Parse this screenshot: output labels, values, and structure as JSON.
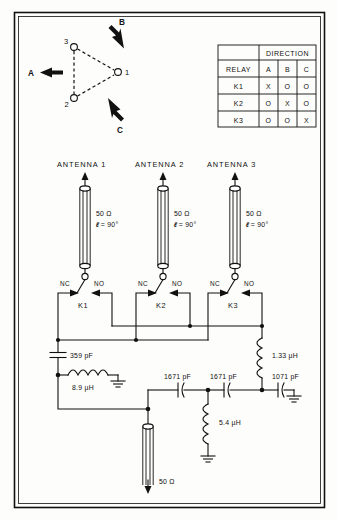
{
  "figure": {
    "border_color": "#111111",
    "background": "#fdfdfb"
  },
  "direction_diagram": {
    "name": "pattern-direction-diagram",
    "nodes": [
      {
        "id": "1",
        "label": "1",
        "x": 118,
        "y": 72
      },
      {
        "id": "2",
        "label": "2",
        "x": 74,
        "y": 98
      },
      {
        "id": "3",
        "label": "3",
        "x": 74,
        "y": 47
      }
    ],
    "arrows": [
      {
        "label": "A",
        "direction": "left"
      },
      {
        "label": "B",
        "direction": "upper-right"
      },
      {
        "label": "C",
        "direction": "lower-right"
      }
    ]
  },
  "relay_table": {
    "name": "relay-direction-table",
    "group_header": "DIRECTION",
    "corner_header": "RELAY",
    "columns": [
      "A",
      "B",
      "C"
    ],
    "rows": [
      {
        "relay": "K1",
        "cells": [
          "X",
          "O",
          "O"
        ]
      },
      {
        "relay": "K2",
        "cells": [
          "O",
          "X",
          "O"
        ]
      },
      {
        "relay": "K3",
        "cells": [
          "O",
          "O",
          "X"
        ]
      }
    ]
  },
  "antennas": [
    {
      "name": "antenna-1",
      "label": "ANTENNA 1",
      "impedance": "50 Ω",
      "length": "= 90°",
      "length_symbol": "ℓ"
    },
    {
      "name": "antenna-2",
      "label": "ANTENNA 2",
      "impedance": "50 Ω",
      "length": "= 90°",
      "length_symbol": "ℓ"
    },
    {
      "name": "antenna-3",
      "label": "ANTENNA 3",
      "impedance": "50 Ω",
      "length": "= 90°",
      "length_symbol": "ℓ"
    }
  ],
  "relays": [
    {
      "name": "relay-k1",
      "label": "K1",
      "nc": "NC",
      "no": "NO"
    },
    {
      "name": "relay-k2",
      "label": "K2",
      "nc": "NC",
      "no": "NO"
    },
    {
      "name": "relay-k3",
      "label": "K3",
      "nc": "NC",
      "no": "NO"
    }
  ],
  "components": {
    "cap_359": "359 pF",
    "ind_89": "8.9 µH",
    "ind_133": "1.33 µH",
    "cap_1671_a": "1671 pF",
    "cap_1671_b": "1671 pF",
    "cap_1071": "1071 pF",
    "ind_54": "5.4 µH"
  },
  "feedline": {
    "name": "main-feedline",
    "impedance": "50 Ω"
  }
}
